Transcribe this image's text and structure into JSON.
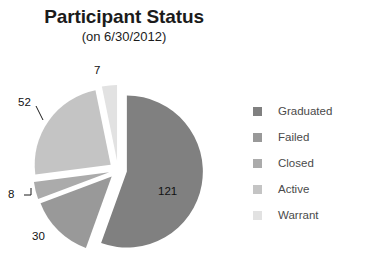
{
  "header": {
    "title": "Participant Status",
    "subtitle": "(on 6/30/2012)"
  },
  "legend": {
    "position": "right",
    "items": [
      {
        "label": "Graduated",
        "color": "#808080"
      },
      {
        "label": "Failed",
        "color": "#999999"
      },
      {
        "label": "Closed",
        "color": "#ababab"
      },
      {
        "label": "Active",
        "color": "#c4c4c4"
      },
      {
        "label": "Warrant",
        "color": "#e2e2e2"
      }
    ]
  },
  "chart_data": {
    "type": "pie",
    "title": "Participant Status",
    "subtitle": "(on 6/30/2012)",
    "xlabel": "",
    "ylabel": "",
    "total": 218,
    "exploded": true,
    "start_angle_deg": 0,
    "direction": "clockwise",
    "legend_position": "right",
    "grid": false,
    "categories": [
      "Graduated",
      "Failed",
      "Closed",
      "Active",
      "Warrant"
    ],
    "values": [
      121,
      30,
      8,
      52,
      7
    ],
    "colors": [
      "#808080",
      "#999999",
      "#ababab",
      "#c4c4c4",
      "#e2e2e2"
    ],
    "data_labels": [
      "121",
      "30",
      "8",
      "52",
      "7"
    ],
    "slices": [
      {
        "name": "Graduated",
        "value": 121,
        "label": "121",
        "color": "#808080",
        "sweep_deg": 199.8,
        "label_inside": true
      },
      {
        "name": "Failed",
        "value": 30,
        "label": "30",
        "color": "#999999",
        "sweep_deg": 49.5,
        "label_inside": false
      },
      {
        "name": "Closed",
        "value": 8,
        "label": "8",
        "color": "#ababab",
        "sweep_deg": 13.2,
        "label_inside": false
      },
      {
        "name": "Active",
        "value": 52,
        "label": "52",
        "color": "#c4c4c4",
        "sweep_deg": 85.9,
        "label_inside": false
      },
      {
        "name": "Warrant",
        "value": 7,
        "label": "7",
        "color": "#e2e2e2",
        "sweep_deg": 11.6,
        "label_inside": false
      }
    ]
  }
}
